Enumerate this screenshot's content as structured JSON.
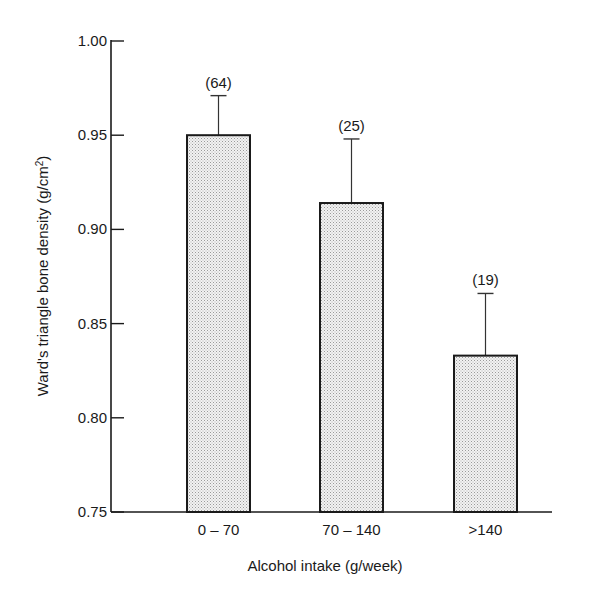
{
  "chart_data": {
    "type": "bar",
    "title": "",
    "xlabel": "Alcohol intake (g/week)",
    "ylabel": "Ward's triangle bone density (g/cm²)",
    "ylabel_main": "Ward's triangle bone density (g/cm",
    "ylabel_sup": "2",
    "ylabel_close": ")",
    "ylim": [
      0.75,
      1.0
    ],
    "yticks": [
      "1.00",
      "0.95",
      "0.90",
      "0.85",
      "0.80",
      "0.75"
    ],
    "categories": [
      "0 – 70",
      "70 – 140",
      ">140"
    ],
    "values": [
      0.95,
      0.914,
      0.833
    ],
    "error_upper": [
      0.971,
      0.948,
      0.866
    ],
    "n_labels": [
      "(64)",
      "(25)",
      "(19)"
    ],
    "grid": false,
    "legend": null,
    "bar_fill": "stippled light gray"
  }
}
